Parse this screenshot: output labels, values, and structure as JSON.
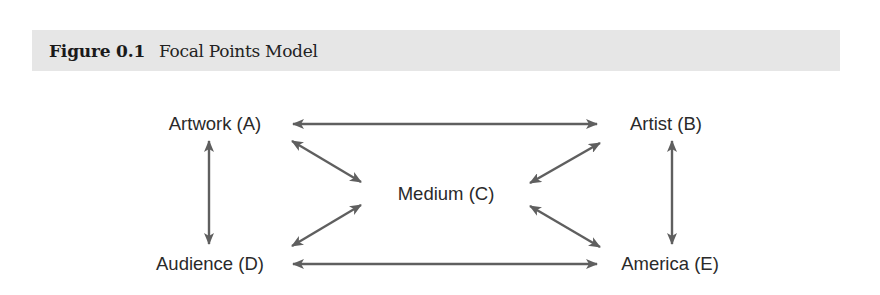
{
  "figure": {
    "number": "Figure 0.1",
    "title": "Focal Points Model",
    "header_bg": "#e6e6e6"
  },
  "diagram": {
    "arrow_color": "#5f5f5f",
    "nodes": [
      {
        "id": "A",
        "label": "Artwork (A)",
        "x": 215,
        "y": 124
      },
      {
        "id": "B",
        "label": "Artist (B)",
        "x": 666,
        "y": 124
      },
      {
        "id": "C",
        "label": "Medium (C)",
        "x": 446,
        "y": 194
      },
      {
        "id": "D",
        "label": "Audience (D)",
        "x": 210,
        "y": 264
      },
      {
        "id": "E",
        "label": "America (E)",
        "x": 670,
        "y": 264
      }
    ],
    "edges": [
      {
        "from": "A",
        "to": "B",
        "bidirectional": true
      },
      {
        "from": "A",
        "to": "D",
        "bidirectional": true
      },
      {
        "from": "B",
        "to": "E",
        "bidirectional": true
      },
      {
        "from": "D",
        "to": "E",
        "bidirectional": true
      },
      {
        "from": "A",
        "to": "C",
        "bidirectional": true
      },
      {
        "from": "D",
        "to": "C",
        "bidirectional": true
      },
      {
        "from": "B",
        "to": "C",
        "bidirectional": true
      },
      {
        "from": "E",
        "to": "C",
        "bidirectional": true
      }
    ]
  }
}
